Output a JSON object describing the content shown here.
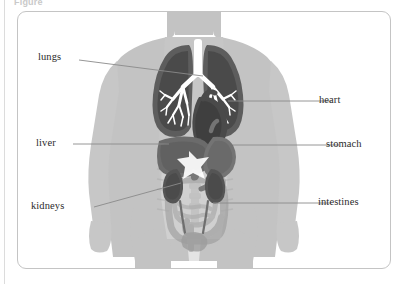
{
  "figure": {
    "caption_top": "Figure",
    "frame": {
      "border_color": "#c4c4c4",
      "background": "#ffffff"
    }
  },
  "colors": {
    "body_fill": "#c3c3c3",
    "body_fill_light": "#cfcfcf",
    "organ_dark": "#5d5d5d",
    "organ_mid": "#767676",
    "organ_light": "#9a9a9a",
    "bronchi_white": "#ffffff",
    "leader_line": "#8a8a8a",
    "label_text": "#2b2b2b",
    "page_edge": "#dcdcdc"
  },
  "labels": [
    {
      "id": "lungs",
      "text": "lungs",
      "side": "left"
    },
    {
      "id": "liver",
      "text": "liver",
      "side": "left"
    },
    {
      "id": "kidneys",
      "text": "kidneys",
      "side": "left"
    },
    {
      "id": "heart",
      "text": "heart",
      "side": "right"
    },
    {
      "id": "stomach",
      "text": "stomach",
      "side": "right"
    },
    {
      "id": "intestines",
      "text": "intestines",
      "side": "right"
    }
  ],
  "organs": [
    {
      "id": "lungs",
      "name": "lungs",
      "shade": "#5d5d5d"
    },
    {
      "id": "heart",
      "name": "heart",
      "shade": "#4f4f4f"
    },
    {
      "id": "liver",
      "name": "liver",
      "shade": "#6b6b6b"
    },
    {
      "id": "stomach",
      "name": "stomach",
      "shade": "#747474"
    },
    {
      "id": "kidneys",
      "name": "kidneys",
      "shade": "#555555"
    },
    {
      "id": "intestines",
      "name": "intestines",
      "shade": "#a8a8a8"
    }
  ]
}
